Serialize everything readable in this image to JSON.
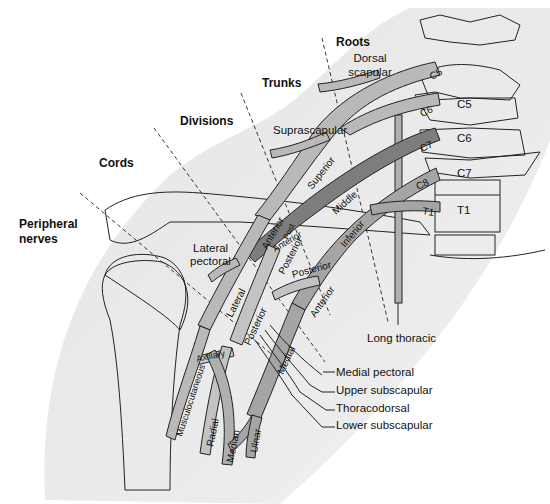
{
  "diagram": {
    "section_headers": {
      "roots": "Roots",
      "trunks": "Trunks",
      "divisions": "Divisions",
      "cords": "Cords",
      "peripheral_nerves_line1": "Peripheral",
      "peripheral_nerves_line2": "nerves"
    },
    "vertebrae": [
      "C5",
      "C6",
      "C7",
      "T1"
    ],
    "roots": [
      "C5",
      "C6",
      "C7",
      "C8",
      "T1"
    ],
    "trunks": [
      "Superior",
      "Middle",
      "Inferior"
    ],
    "divisions": [
      "Anterior",
      "Post",
      "Anterior",
      "Posterior",
      "Posterior",
      "Anterior"
    ],
    "cords": [
      "Lateral",
      "Posterior",
      "Medial"
    ],
    "terminal_nerves": [
      "Axillary",
      "Musculocutaneous",
      "Radial",
      "Median",
      "Ulnar"
    ],
    "branch_labels": {
      "dorsal_scapular_1": "Dorsal",
      "dorsal_scapular_2": "scapular",
      "suprascapular": "Suprascapular",
      "lateral_pectoral_1": "Lateral",
      "lateral_pectoral_2": "pectoral",
      "long_thoracic": "Long thoracic",
      "medial_pectoral": "Medial pectoral",
      "upper_subscapular": "Upper subscapular",
      "thoracodorsal": "Thoracodorsal",
      "lower_subscapular": "Lower subscapular"
    },
    "colors": {
      "skin_shade": "#e8e8e8",
      "nerve_light": "#b9b9b9",
      "nerve_mid": "#9a9a9a",
      "nerve_dark": "#7d7d7d",
      "bone": "#eeeeee",
      "outline": "#222222"
    }
  }
}
